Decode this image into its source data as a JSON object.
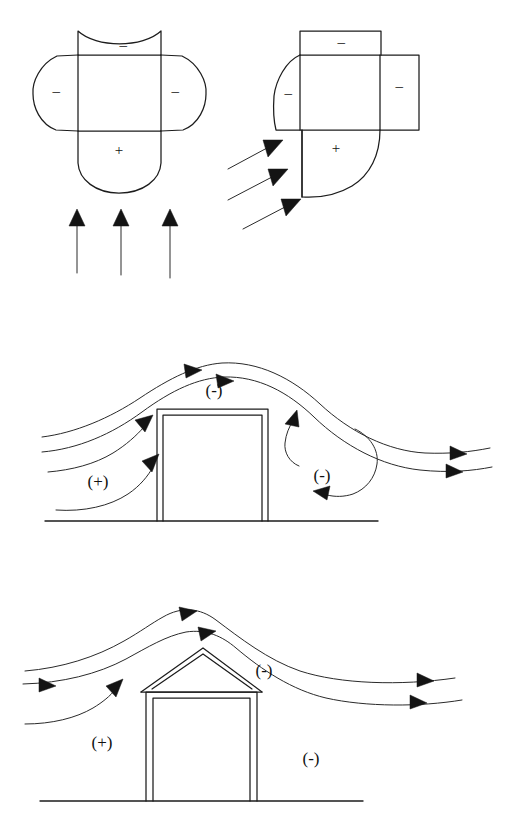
{
  "figure": {
    "background_color": "#ffffff",
    "line_color": "#1c1c1c",
    "arrow_fill": "#141414"
  },
  "panels": [
    {
      "id": "plan-normal",
      "name": "plan-view-wind-normal",
      "description": "Plan view of a rectangular building with wind striking the face perpendicularly",
      "wind_direction": "perpendicular",
      "arrow_count": 3,
      "labels": [
        {
          "id": "top-suction",
          "text": "–",
          "zone": "leeward-wall",
          "sign": "negative",
          "x": 123,
          "y": 47
        },
        {
          "id": "left-suction",
          "text": "–",
          "zone": "side-wall-left",
          "sign": "negative",
          "x": 56,
          "y": 93
        },
        {
          "id": "right-suction",
          "text": "–",
          "zone": "side-wall-right",
          "sign": "negative",
          "x": 175,
          "y": 93
        },
        {
          "id": "bottom-pressure",
          "text": "+",
          "zone": "windward-wall",
          "sign": "positive",
          "x": 119,
          "y": 152
        }
      ]
    },
    {
      "id": "plan-oblique",
      "name": "plan-view-wind-oblique",
      "description": "Plan view of a rectangular building with wind striking at an oblique angle",
      "wind_direction": "oblique-45-degrees",
      "arrow_count": 3,
      "labels": [
        {
          "id": "top-suction",
          "text": "–",
          "zone": "leeward-wall-top",
          "sign": "negative",
          "x": 341,
          "y": 44
        },
        {
          "id": "right-suction",
          "text": "–",
          "zone": "leeward-wall-right",
          "sign": "negative",
          "x": 393,
          "y": 88
        },
        {
          "id": "left-suction",
          "text": "–",
          "zone": "side-wall-left",
          "sign": "negative",
          "x": 290,
          "y": 95
        },
        {
          "id": "center-pressure",
          "text": "+",
          "zone": "windward-wall",
          "sign": "positive",
          "x": 336,
          "y": 150
        }
      ]
    },
    {
      "id": "section-flat-roof",
      "name": "section-flat-roof-building",
      "description": "Section through a flat-roofed building showing wind streamlines, positive windward pressure, negative roof and leeward suction with a recirculating eddy",
      "roof_type": "flat",
      "streamline_count": 4,
      "has_eddy": true,
      "labels": [
        {
          "id": "roof-suction",
          "text": "(-)",
          "zone": "roof",
          "sign": "negative",
          "x": 214,
          "y": 392
        },
        {
          "id": "windward-pressure",
          "text": "(+)",
          "zone": "windward-wall",
          "sign": "positive",
          "x": 98,
          "y": 483
        },
        {
          "id": "leeward-suction",
          "text": "(-)",
          "zone": "leeward-wake",
          "sign": "negative",
          "x": 322,
          "y": 477
        }
      ]
    },
    {
      "id": "section-gable-roof",
      "name": "section-gable-roof-building",
      "description": "Section through a gable-roofed building showing wind streamlines, positive windward pressure and negative leeward suction",
      "roof_type": "gable",
      "streamline_count": 3,
      "has_eddy": false,
      "labels": [
        {
          "id": "roof-suction",
          "text": "(-)",
          "zone": "leeward-roof",
          "sign": "negative",
          "x": 264,
          "y": 672
        },
        {
          "id": "windward-pressure",
          "text": "(+)",
          "zone": "windward-wall",
          "sign": "positive",
          "x": 102,
          "y": 744
        },
        {
          "id": "leeward-suction",
          "text": "(-)",
          "zone": "leeward-wake",
          "sign": "negative",
          "x": 311,
          "y": 760
        }
      ]
    }
  ]
}
